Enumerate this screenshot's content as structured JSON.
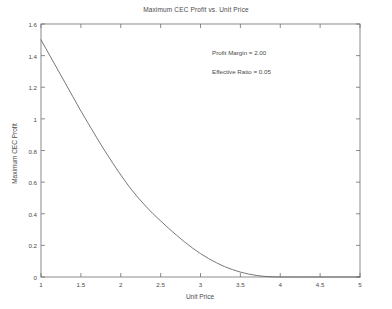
{
  "figure": {
    "background": "#ffffff",
    "axis_color": "#6e6e6e",
    "curve_color": "#555555",
    "text_color": "#4a4a4a"
  },
  "annotations": {
    "profit_margin": "Profit Margin = 2.00",
    "effective_ratio": "Effective Ratio = 0.05"
  },
  "chart_data": {
    "type": "line",
    "title": "Maximum CEC Profit vs. Unit Price",
    "xlabel": "Unit Price",
    "ylabel": "Maximum CEC Profit",
    "xlim": [
      1,
      5
    ],
    "ylim": [
      0,
      1.6
    ],
    "xticks": [
      1,
      1.5,
      2,
      2.5,
      3,
      3.5,
      4,
      4.5,
      5
    ],
    "xticklabels": [
      "1",
      "1.5",
      "2",
      "2.5",
      "3",
      "3.5",
      "4",
      "4.5",
      "5"
    ],
    "yticks": [
      0,
      0.2,
      0.4,
      0.6,
      0.8,
      1,
      1.2,
      1.4,
      1.6
    ],
    "yticklabels": [
      "0",
      "0.2",
      "0.4",
      "0.6",
      "0.8",
      "1",
      "1.2",
      "1.4",
      "1.6"
    ],
    "grid": false,
    "legend": null,
    "box": true,
    "tick_direction": "in",
    "series": [
      {
        "name": "Maximum CEC Profit",
        "color": "#555555",
        "x": [
          1.0,
          1.1,
          1.2,
          1.3,
          1.4,
          1.5,
          1.6,
          1.7,
          1.8,
          1.9,
          2.0,
          2.1,
          2.2,
          2.3,
          2.4,
          2.5,
          2.6,
          2.7,
          2.8,
          2.9,
          3.0,
          3.1,
          3.2,
          3.3,
          3.4,
          3.5,
          3.6,
          3.7,
          3.8,
          3.9,
          4.0,
          4.2,
          4.4,
          4.6,
          4.8,
          5.0
        ],
        "y": [
          1.5,
          1.41,
          1.32,
          1.23,
          1.14,
          1.05,
          0.965,
          0.88,
          0.798,
          0.72,
          0.645,
          0.575,
          0.512,
          0.455,
          0.402,
          0.355,
          0.308,
          0.264,
          0.222,
          0.183,
          0.148,
          0.117,
          0.09,
          0.066,
          0.047,
          0.031,
          0.019,
          0.01,
          0.004,
          0.001,
          0.0,
          0.0,
          0.0,
          0.0,
          0.0,
          0.0
        ]
      }
    ]
  }
}
